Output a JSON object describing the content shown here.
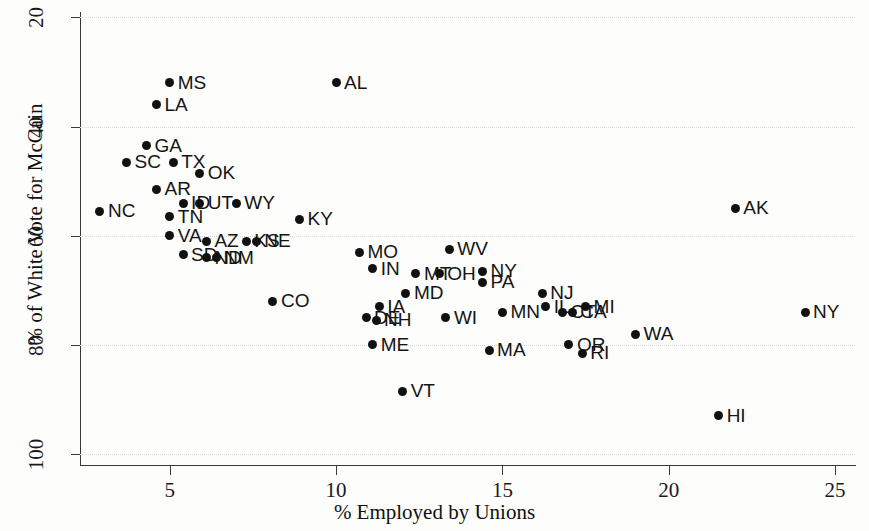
{
  "chart_data": {
    "type": "scatter",
    "title": "",
    "xlabel": "% Employed by Unions",
    "ylabel": "% of White Vote for McCain",
    "xlim": [
      2.3,
      25.6
    ],
    "ylim": [
      18,
      101
    ],
    "xticks": [
      5,
      10,
      15,
      20,
      25
    ],
    "yticks": [
      20,
      40,
      60,
      80,
      100
    ],
    "grid": "horizontal-dotted",
    "legend": "none",
    "point_color": "#111111",
    "points": [
      {
        "label": "MS",
        "x": 5.0,
        "y": 88.0
      },
      {
        "label": "LA",
        "x": 4.6,
        "y": 84.0
      },
      {
        "label": "AL",
        "x": 10.0,
        "y": 88.0
      },
      {
        "label": "GA",
        "x": 4.3,
        "y": 76.5
      },
      {
        "label": "SC",
        "x": 3.7,
        "y": 73.5
      },
      {
        "label": "TX",
        "x": 5.1,
        "y": 73.5
      },
      {
        "label": "OK",
        "x": 5.9,
        "y": 71.5
      },
      {
        "label": "AR",
        "x": 4.6,
        "y": 68.5
      },
      {
        "label": "NC",
        "x": 2.9,
        "y": 64.5
      },
      {
        "label": "ID",
        "x": 5.4,
        "y": 66.0
      },
      {
        "label": "UT",
        "x": 5.9,
        "y": 66.0
      },
      {
        "label": "WY",
        "x": 7.0,
        "y": 66.0
      },
      {
        "label": "TN",
        "x": 5.0,
        "y": 63.5
      },
      {
        "label": "KY",
        "x": 8.9,
        "y": 63.0
      },
      {
        "label": "VA",
        "x": 5.0,
        "y": 60.0
      },
      {
        "label": "AZ",
        "x": 6.1,
        "y": 59.0
      },
      {
        "label": "KS",
        "x": 7.3,
        "y": 59.0
      },
      {
        "label": "NE",
        "x": 7.6,
        "y": 59.0
      },
      {
        "label": "SD",
        "x": 5.4,
        "y": 56.5
      },
      {
        "label": "ND",
        "x": 6.1,
        "y": 56.0
      },
      {
        "label": "NM",
        "x": 6.4,
        "y": 56.0
      },
      {
        "label": "MO",
        "x": 10.7,
        "y": 57.0
      },
      {
        "label": "WV",
        "x": 13.4,
        "y": 57.5
      },
      {
        "label": "IN",
        "x": 11.1,
        "y": 54.0
      },
      {
        "label": "MT",
        "x": 12.4,
        "y": 53.0
      },
      {
        "label": "OH",
        "x": 13.1,
        "y": 53.0
      },
      {
        "label": "NY",
        "x": 14.4,
        "y": 53.5
      },
      {
        "label": "PA",
        "x": 14.4,
        "y": 51.5
      },
      {
        "label": "MD",
        "x": 12.1,
        "y": 49.5
      },
      {
        "label": "CO",
        "x": 8.1,
        "y": 48.0
      },
      {
        "label": "IA",
        "x": 11.3,
        "y": 47.0
      },
      {
        "label": "DE",
        "x": 10.9,
        "y": 45.0
      },
      {
        "label": "NH",
        "x": 11.2,
        "y": 44.5
      },
      {
        "label": "WI",
        "x": 13.3,
        "y": 45.0
      },
      {
        "label": "MN",
        "x": 15.0,
        "y": 46.0
      },
      {
        "label": "NJ",
        "x": 16.2,
        "y": 49.5
      },
      {
        "label": "IL",
        "x": 16.3,
        "y": 47.0
      },
      {
        "label": "CT",
        "x": 16.8,
        "y": 46.0
      },
      {
        "label": "CA",
        "x": 17.1,
        "y": 46.0
      },
      {
        "label": "MI",
        "x": 17.5,
        "y": 47.0
      },
      {
        "label": "ME",
        "x": 11.1,
        "y": 40.0
      },
      {
        "label": "MA",
        "x": 14.6,
        "y": 39.0
      },
      {
        "label": "OR",
        "x": 17.0,
        "y": 40.0
      },
      {
        "label": "RI",
        "x": 17.4,
        "y": 38.5
      },
      {
        "label": "WA",
        "x": 19.0,
        "y": 42.0
      },
      {
        "label": "AK",
        "x": 22.0,
        "y": 65.0
      },
      {
        "label": "NY2",
        "x": 24.1,
        "y": 46.0
      },
      {
        "label": "VT",
        "x": 12.0,
        "y": 31.5
      },
      {
        "label": "HI",
        "x": 21.5,
        "y": 27.0
      }
    ],
    "point_label_overrides": {
      "NY2": "NY"
    }
  },
  "axes": {
    "y_tick_labels": [
      "100",
      "80",
      "60",
      "40",
      "20"
    ],
    "x_tick_labels": [
      "5",
      "10",
      "15",
      "20",
      "25"
    ]
  }
}
